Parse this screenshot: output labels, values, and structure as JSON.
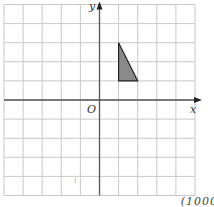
{
  "diagram": {
    "grid": {
      "x_min": -5,
      "x_max": 5,
      "y_min": -5,
      "y_max": 5,
      "cell_px": 19.1,
      "origin_px": [
        99.5,
        100
      ],
      "line_color": "#c8c8c8"
    },
    "axes": {
      "x_label": "x",
      "y_label": "y",
      "origin_label": "O",
      "color": "#555555"
    },
    "shape": {
      "type": "triangle",
      "vertices": [
        [
          1,
          3
        ],
        [
          1,
          1
        ],
        [
          2,
          1
        ]
      ],
      "fill": "#8a8a8a",
      "stroke": "#222222"
    },
    "stray_mark": "ꭍ",
    "footer_text": "(1000"
  }
}
